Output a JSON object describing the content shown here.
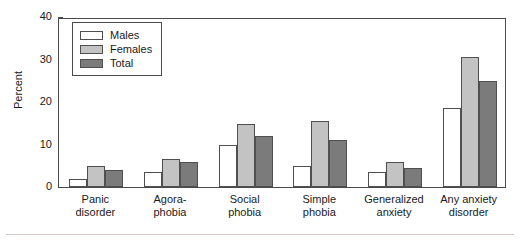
{
  "chart_data": {
    "type": "bar",
    "title": "",
    "xlabel": "",
    "ylabel": "Percent",
    "ylim": [
      0,
      40
    ],
    "yticks": [
      0,
      10,
      20,
      30,
      40
    ],
    "grid": false,
    "legend_position": "top-left",
    "categories": [
      "Panic\ndisorder",
      "Agora-\nphobia",
      "Social\nphobia",
      "Simple\nphobia",
      "Generalized\nanxiety",
      "Any anxiety\ndisorder"
    ],
    "series": [
      {
        "name": "Males",
        "color": "#ffffff",
        "values": [
          2.0,
          3.5,
          10.0,
          5.0,
          3.5,
          18.5
        ]
      },
      {
        "name": "Females",
        "color": "#c3c3c3",
        "values": [
          5.0,
          6.5,
          14.8,
          15.5,
          6.0,
          30.5
        ]
      },
      {
        "name": "Total",
        "color": "#7b7b7b",
        "values": [
          4.0,
          5.8,
          12.0,
          11.0,
          4.5,
          25.0
        ]
      }
    ]
  },
  "legend": {
    "items": [
      {
        "label": "Males"
      },
      {
        "label": "Females"
      },
      {
        "label": "Total"
      }
    ]
  }
}
